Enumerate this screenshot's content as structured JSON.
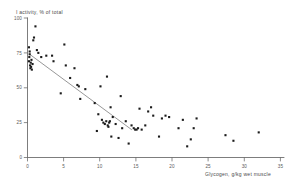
{
  "chart_data": {
    "type": "scatter",
    "title": "",
    "ylabel": "I activity, % of total",
    "xlabel": "Glycogen, g/kg wet muscle",
    "xlim": [
      0,
      35
    ],
    "ylim": [
      0,
      100
    ],
    "xticks": [
      0,
      5,
      10,
      15,
      20,
      25,
      30,
      35
    ],
    "yticks": [
      0,
      25,
      50,
      75,
      100
    ],
    "xtick_labels": [
      "0",
      "5",
      "10",
      "15",
      "20",
      "25",
      "30",
      "35"
    ],
    "ytick_labels": [
      "0",
      "25",
      "50",
      "75",
      "100"
    ],
    "grid": false,
    "legend": false,
    "marker_color": "#1b1b1b",
    "line_color": "#8b8b8b",
    "axis_color": "#6e6e6e",
    "points": [
      [
        0.2,
        79
      ],
      [
        0.3,
        76
      ],
      [
        0.25,
        72
      ],
      [
        0.2,
        69
      ],
      [
        0.35,
        66
      ],
      [
        0.5,
        65
      ],
      [
        0.4,
        64
      ],
      [
        0.6,
        63
      ],
      [
        0.45,
        68
      ],
      [
        0.3,
        74
      ],
      [
        0.55,
        70
      ],
      [
        0.7,
        67
      ],
      [
        0.8,
        84
      ],
      [
        0.9,
        86
      ],
      [
        1.1,
        94
      ],
      [
        1.3,
        77
      ],
      [
        1.5,
        75
      ],
      [
        1.9,
        72
      ],
      [
        2.6,
        73
      ],
      [
        3.4,
        73
      ],
      [
        3.6,
        69
      ],
      [
        4.6,
        46
      ],
      [
        5.1,
        81
      ],
      [
        5.3,
        66
      ],
      [
        5.9,
        57
      ],
      [
        6.5,
        64
      ],
      [
        6.9,
        52
      ],
      [
        7.1,
        51
      ],
      [
        7.3,
        42
      ],
      [
        8.0,
        49
      ],
      [
        9.3,
        39
      ],
      [
        9.6,
        19
      ],
      [
        9.8,
        31
      ],
      [
        10.1,
        51
      ],
      [
        10.3,
        27
      ],
      [
        10.5,
        25
      ],
      [
        10.7,
        24
      ],
      [
        10.9,
        26
      ],
      [
        11.0,
        58
      ],
      [
        11.1,
        23
      ],
      [
        11.2,
        22
      ],
      [
        11.3,
        25
      ],
      [
        11.4,
        26
      ],
      [
        11.5,
        36
      ],
      [
        11.6,
        15
      ],
      [
        11.8,
        29
      ],
      [
        12.2,
        24
      ],
      [
        12.6,
        14
      ],
      [
        12.9,
        44
      ],
      [
        13.1,
        21
      ],
      [
        13.6,
        26
      ],
      [
        14.0,
        10
      ],
      [
        14.4,
        23
      ],
      [
        14.7,
        21
      ],
      [
        14.9,
        20
      ],
      [
        15.1,
        20
      ],
      [
        15.3,
        21
      ],
      [
        15.5,
        35
      ],
      [
        15.8,
        20
      ],
      [
        16.3,
        23
      ],
      [
        16.7,
        33
      ],
      [
        17.1,
        36
      ],
      [
        17.4,
        30
      ],
      [
        18.2,
        15
      ],
      [
        18.6,
        28
      ],
      [
        19.1,
        30
      ],
      [
        19.6,
        29
      ],
      [
        20.9,
        21
      ],
      [
        21.5,
        27
      ],
      [
        22.1,
        8
      ],
      [
        22.6,
        13
      ],
      [
        23.0,
        21
      ],
      [
        23.4,
        28
      ],
      [
        27.4,
        16
      ],
      [
        28.5,
        12
      ],
      [
        32.0,
        18
      ]
    ],
    "fit_line": {
      "x_start": 0.3,
      "y_start": 74,
      "x_end": 14.4,
      "y_end": 20
    }
  }
}
